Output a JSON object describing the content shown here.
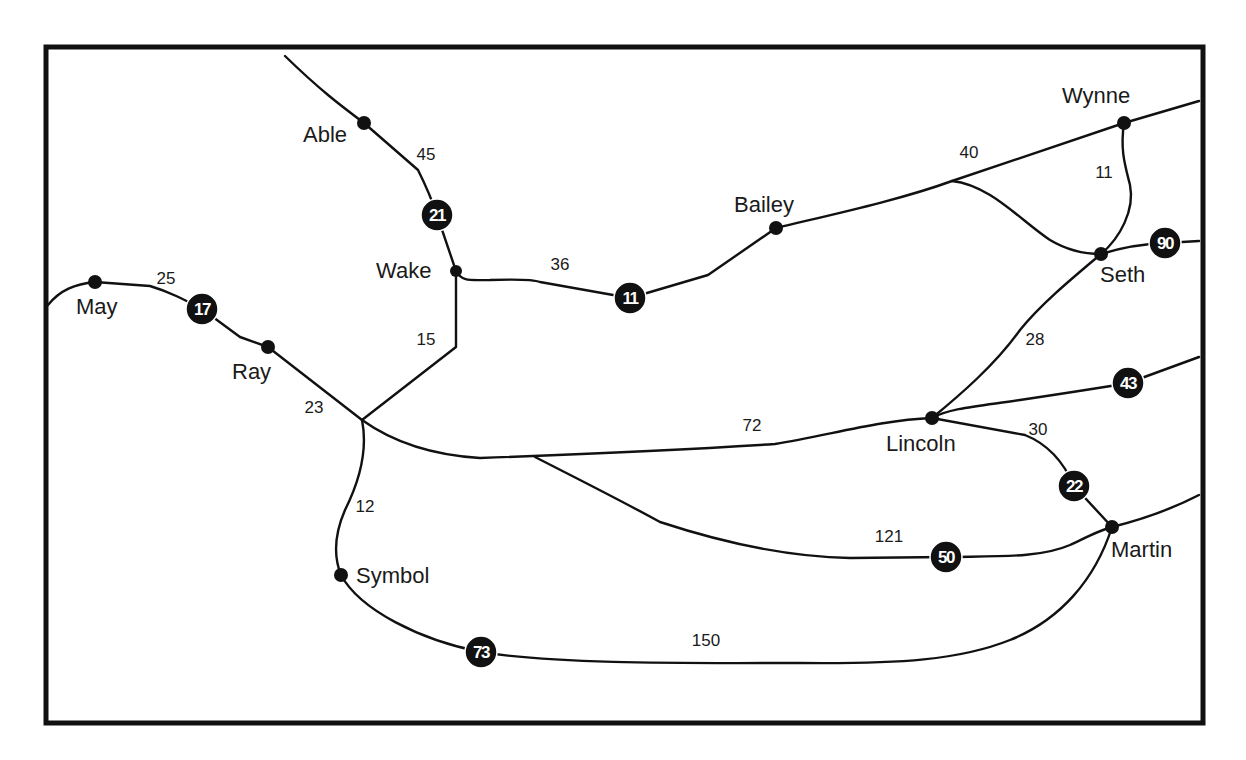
{
  "map": {
    "towns": [
      {
        "name": "Able",
        "x": 364,
        "y": 123
      },
      {
        "name": "Wake",
        "x": 456,
        "y": 271
      },
      {
        "name": "May",
        "x": 95,
        "y": 282
      },
      {
        "name": "Ray",
        "x": 268,
        "y": 347
      },
      {
        "name": "Bailey",
        "x": 776,
        "y": 228
      },
      {
        "name": "Wynne",
        "x": 1124,
        "y": 123
      },
      {
        "name": "Seth",
        "x": 1101,
        "y": 254
      },
      {
        "name": "Lincoln",
        "x": 932,
        "y": 418
      },
      {
        "name": "Martin",
        "x": 1112,
        "y": 527
      },
      {
        "name": "Symbol",
        "x": 341,
        "y": 575
      }
    ],
    "route_shields": [
      {
        "number": "21",
        "x": 437,
        "y": 215
      },
      {
        "number": "17",
        "x": 202,
        "y": 309
      },
      {
        "number": "11",
        "x": 630,
        "y": 298
      },
      {
        "number": "90",
        "x": 1165,
        "y": 243
      },
      {
        "number": "43",
        "x": 1128,
        "y": 383
      },
      {
        "number": "22",
        "x": 1074,
        "y": 486
      },
      {
        "number": "50",
        "x": 946,
        "y": 557
      },
      {
        "number": "73",
        "x": 481,
        "y": 652
      }
    ],
    "distances": [
      {
        "label": "45",
        "x": 426,
        "y": 160
      },
      {
        "label": "25",
        "x": 166,
        "y": 284
      },
      {
        "label": "36",
        "x": 560,
        "y": 270
      },
      {
        "label": "40",
        "x": 969,
        "y": 158
      },
      {
        "label": "11",
        "x": 1104,
        "y": 178
      },
      {
        "label": "15",
        "x": 426,
        "y": 345
      },
      {
        "label": "23",
        "x": 314,
        "y": 413
      },
      {
        "label": "28",
        "x": 1035,
        "y": 345
      },
      {
        "label": "72",
        "x": 752,
        "y": 431
      },
      {
        "label": "30",
        "x": 1038,
        "y": 435
      },
      {
        "label": "12",
        "x": 365,
        "y": 512
      },
      {
        "label": "121",
        "x": 889,
        "y": 542
      },
      {
        "label": "150",
        "x": 706,
        "y": 646
      }
    ]
  }
}
